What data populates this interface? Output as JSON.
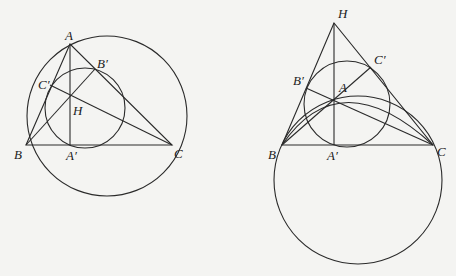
{
  "figures": [
    {
      "name": "left-figure",
      "labels": {
        "A": "A",
        "B": "B",
        "C": "C",
        "A1": "A′",
        "B1": "B′",
        "C1": "C′",
        "H": "H"
      },
      "points": {
        "A": [
          70,
          44
        ],
        "B": [
          26,
          145
        ],
        "C": [
          172,
          145
        ],
        "A1": [
          70,
          145
        ],
        "B1": [
          95,
          69
        ],
        "C1": [
          50,
          85
        ],
        "H": [
          70,
          96
        ]
      },
      "circumcircle": {
        "cx": 107,
        "cy": 116,
        "r": 80
      },
      "nine_point_circle": {
        "cx": 85,
        "cy": 108,
        "r": 40
      }
    },
    {
      "name": "right-figure",
      "labels": {
        "A": "A",
        "B": "B",
        "C": "C",
        "A1": "A′",
        "B1": "B′",
        "C1": "C′",
        "H": "H"
      },
      "points": {
        "H": [
          334,
          23
        ],
        "A": [
          334,
          99
        ],
        "B": [
          282,
          145
        ],
        "C": [
          433,
          145
        ],
        "A1": [
          334,
          145
        ],
        "B1": [
          306,
          88
        ],
        "C1": [
          371,
          67
        ]
      },
      "large_circle": {
        "cx": 358,
        "cy": 180,
        "r": 84
      },
      "nine_point_circle": {
        "cx": 347,
        "cy": 104,
        "r": 43
      }
    }
  ]
}
